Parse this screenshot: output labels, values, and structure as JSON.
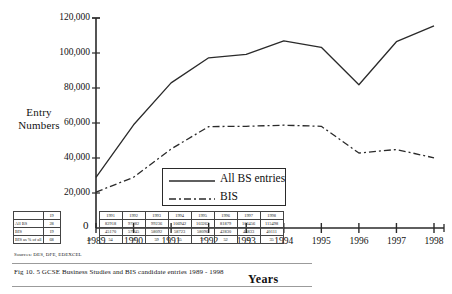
{
  "figure": {
    "caption": "Fig 10. 5 GCSE Business Studies and BIS candidate entries 1989 - 1998",
    "sources": "Sources: DES, DFE, EDEXCEL",
    "axis_title_x": "Years",
    "axis_title_y_line1": "Entry",
    "axis_title_y_line2": "Numbers",
    "zero_label": "0"
  },
  "legend": {
    "items": [
      {
        "label": "All BS entries",
        "style": "solid"
      },
      {
        "label": "BIS",
        "style": "dash-dot"
      }
    ]
  },
  "table": {
    "row_labels": [
      "",
      "All BS",
      "BIS",
      "BIS as % of all"
    ],
    "head_partial": [
      "19",
      "1991",
      "1992",
      "1993",
      "1994",
      "1995",
      "1996",
      "1997",
      "1998"
    ],
    "left_partial": {
      "header": "19",
      "all_bs": "28",
      "bis": "19",
      "pct": "68",
      "pct_extra": "48"
    },
    "columns": [
      "1991",
      "1992",
      "1993",
      "1994",
      "1995",
      "1996",
      "1997",
      "1998"
    ],
    "all_bs": [
      "82918",
      "97282",
      "99236",
      "106942",
      "103262",
      "81879",
      "106456",
      "115498"
    ],
    "bis": [
      "45170",
      "57945",
      "58092",
      "58723",
      "58096",
      "42830",
      "44833",
      "40111"
    ],
    "pct_of_all": [
      "54",
      "59",
      "59",
      "55",
      "37",
      "52",
      "42",
      "35"
    ]
  },
  "chart_data": {
    "type": "line",
    "title": "Fig 10. 5 GCSE Business Studies and BIS candidate entries 1989 - 1998",
    "xlabel": "Years",
    "ylabel": "Entry Numbers",
    "x": [
      "1989",
      "1990",
      "1991",
      "1992",
      "1993",
      "1994",
      "1995",
      "1996",
      "1997",
      "1998"
    ],
    "xlim": [
      "1989",
      "1998"
    ],
    "ylim": [
      0,
      120000
    ],
    "yticks": [
      20000,
      40000,
      60000,
      80000,
      100000,
      120000
    ],
    "ytick_labels": [
      "20,000",
      "40,000",
      "60,000",
      "80,000",
      "100,000",
      "120,000"
    ],
    "xtick_labels": [
      "1989",
      "1990",
      "1991",
      "1992",
      "1993",
      "1994",
      "1995",
      "1996",
      "1997",
      "1998"
    ],
    "grid": false,
    "legend_position": "center",
    "series": [
      {
        "name": "All BS entries",
        "style": "solid",
        "color": "#2a2a2a",
        "values": [
          29000,
          59000,
          82918,
          97282,
          99236,
          106942,
          103262,
          81879,
          106456,
          115498
        ]
      },
      {
        "name": "BIS",
        "style": "dash-dot",
        "color": "#2a2a2a",
        "values": [
          20500,
          29000,
          45170,
          57945,
          58092,
          58723,
          58096,
          42830,
          44833,
          40111
        ]
      }
    ]
  }
}
